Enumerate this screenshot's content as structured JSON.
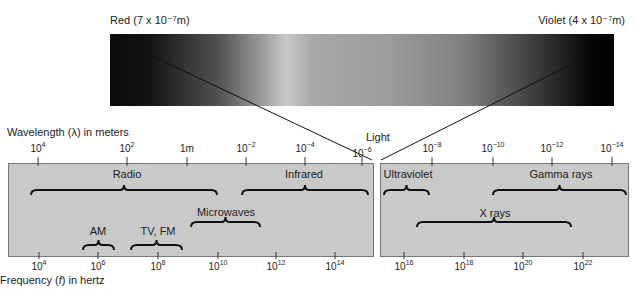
{
  "visible_light": {
    "red_label": "Red (7 x 10⁻⁷m)",
    "violet_label": "Violet (4 x 10⁻⁷m)",
    "light_label": "Light"
  },
  "wavelength_axis": {
    "title": "Wavelength (λ) in meters",
    "ticks": [
      {
        "base": "10",
        "exp": "4",
        "x": 38
      },
      {
        "base": "10",
        "exp": "2",
        "x": 127
      },
      {
        "base": "1m",
        "exp": "",
        "x": 187
      },
      {
        "base": "10",
        "exp": "−2",
        "x": 246
      },
      {
        "base": "10",
        "exp": "−4",
        "x": 305
      },
      {
        "base": "10",
        "exp": "−6",
        "x": 362
      },
      {
        "base": "10",
        "exp": "−8",
        "x": 432
      },
      {
        "base": "10",
        "exp": "−10",
        "x": 493
      },
      {
        "base": "10",
        "exp": "−12",
        "x": 552
      },
      {
        "base": "10",
        "exp": "−14",
        "x": 612
      }
    ]
  },
  "frequency_axis": {
    "title": "Frequency (f) in hertz",
    "ticks": [
      {
        "base": "10",
        "exp": "4",
        "x": 39
      },
      {
        "base": "10",
        "exp": "6",
        "x": 98
      },
      {
        "base": "10",
        "exp": "8",
        "x": 158
      },
      {
        "base": "10",
        "exp": "10",
        "x": 218
      },
      {
        "base": "10",
        "exp": "12",
        "x": 276
      },
      {
        "base": "10",
        "exp": "14",
        "x": 335
      },
      {
        "base": "10",
        "exp": "16",
        "x": 404
      },
      {
        "base": "10",
        "exp": "18",
        "x": 464
      },
      {
        "base": "10",
        "exp": "20",
        "x": 523
      },
      {
        "base": "10",
        "exp": "22",
        "x": 583
      }
    ]
  },
  "bands": [
    {
      "name": "Radio",
      "label_x": 127,
      "label_y": 168,
      "x1": 31,
      "x2": 217,
      "y": 190
    },
    {
      "name": "Infrared",
      "label_x": 304,
      "label_y": 168,
      "x1": 242,
      "x2": 368,
      "y": 190
    },
    {
      "name": "Microwaves",
      "label_x": 226,
      "label_y": 206,
      "x1": 191,
      "x2": 260,
      "y": 222
    },
    {
      "name": "AM",
      "label_x": 98,
      "label_y": 225,
      "x1": 83,
      "x2": 114,
      "y": 245
    },
    {
      "name": "TV, FM",
      "label_x": 158,
      "label_y": 225,
      "x1": 131,
      "x2": 182,
      "y": 245
    },
    {
      "name": "Ultraviolet",
      "label_x": 408,
      "label_y": 168,
      "x1": 384,
      "x2": 429,
      "y": 190
    },
    {
      "name": "Gamma rays",
      "label_x": 561,
      "label_y": 168,
      "x1": 493,
      "x2": 626,
      "y": 190
    },
    {
      "name": "X rays",
      "label_x": 495,
      "label_y": 207,
      "x1": 417,
      "x2": 571,
      "y": 222
    }
  ]
}
